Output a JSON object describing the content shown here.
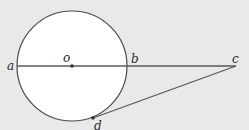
{
  "diagram": {
    "type": "geometry",
    "colors": {
      "background": "#e9e9e9",
      "circle_fill": "#ffffff",
      "stroke": "#4a4a4a",
      "point": "#333333",
      "label": "#2a2a2a"
    },
    "points": {
      "a": {
        "label": "a"
      },
      "o": {
        "label": "o"
      },
      "b": {
        "label": "b"
      },
      "c": {
        "label": "c"
      },
      "d": {
        "label": "d"
      }
    },
    "segments": [
      {
        "from": "a",
        "to": "c",
        "name": "line-ac"
      },
      {
        "from": "c",
        "to": "d",
        "name": "tangent-cd"
      }
    ],
    "circle": {
      "center": "o",
      "through": [
        "a",
        "b",
        "d"
      ]
    }
  }
}
